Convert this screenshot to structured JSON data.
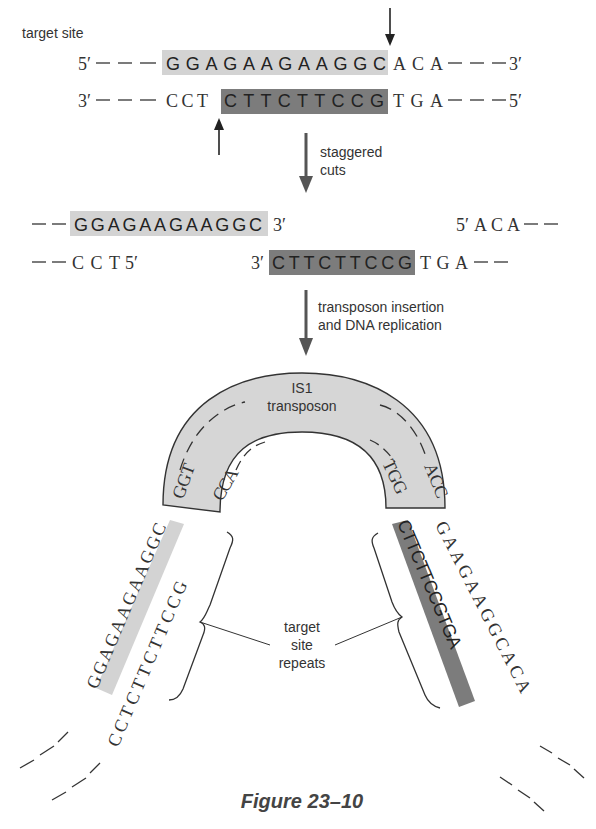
{
  "labels": {
    "target_site": "target site",
    "step1": [
      "staggered",
      "cuts"
    ],
    "step2": [
      "transposon insertion",
      "and DNA replication"
    ],
    "transposon": [
      "IS1",
      "transposon"
    ],
    "repeats": [
      "target",
      "site",
      "repeats"
    ],
    "caption": "Figure 23–10"
  },
  "top_strand": {
    "left_end": "5′",
    "prefix": "———",
    "target": "GGAGAAGAAGGC",
    "suffix": "ACA",
    "right_end": "3′"
  },
  "bottom_strand": {
    "left_end": "3′",
    "prefix": "CCT",
    "target": "CTTCTTCCG",
    "suffix": "TGA",
    "right_end": "5′"
  },
  "cut_products": {
    "left_top": "GGAGAAGAAGGC",
    "left_top_end": "3′",
    "left_bottom": "CCT",
    "left_bottom_end": "5′",
    "right_top_end": "5′",
    "right_top": "ACA",
    "right_bottom_end": "3′",
    "right_bottom_target": "CTTCTTCCG",
    "right_bottom_suffix": "TGA"
  },
  "transposon_ends": {
    "outer_left": "GGT",
    "inner_left": "CCA",
    "inner_right": "TGG",
    "outer_right": "ACC"
  },
  "final": {
    "left_outer": "GGAGAAGAAGGC",
    "left_inner": "CCTCTTCTTCCG",
    "right_inner": "CTTCTTCCGTGA",
    "right_outer": "GAAGAAGGCACA"
  },
  "colors": {
    "light_shade": "#d0d0d0",
    "dark_shade": "#7a7a7a",
    "transposon_fill": "#d6d6d6",
    "text": "#333333"
  }
}
